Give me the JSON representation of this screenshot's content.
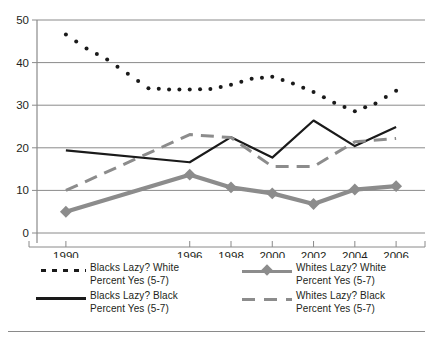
{
  "chart_data": {
    "type": "line",
    "title": "",
    "subtitle": "",
    "xlabel": "",
    "ylabel": "",
    "xlim": [
      1988.6,
      2007.4
    ],
    "ylim": [
      0,
      50
    ],
    "grid": true,
    "legend_position": "bottom",
    "x_tick_labels": [
      "1990",
      "1996",
      "1998",
      "2000",
      "2002",
      "2004",
      "2006"
    ],
    "x_ticks": [
      1990,
      1996,
      1998,
      2000,
      2002,
      2004,
      2006
    ],
    "y_tick_labels": [
      "0",
      "10",
      "20",
      "30",
      "40",
      "50"
    ],
    "y_ticks": [
      0,
      10,
      20,
      30,
      40,
      50
    ],
    "series": [
      {
        "name": "Blacks Lazy? White Percent Yes (5-7)",
        "style": "dotted",
        "color": "#1a1a1a",
        "marker": "dot",
        "x": [
          1990,
          1991,
          1992,
          1993,
          1994,
          1995,
          1996,
          1997,
          1998,
          1999,
          2000,
          2001,
          2002,
          2003,
          2004,
          2005,
          2006
        ],
        "values": [
          46.6,
          43.3,
          40.7,
          37.4,
          34.0,
          33.7,
          33.7,
          33.8,
          34.8,
          36.2,
          36.7,
          35.1,
          33.1,
          30.6,
          28.6,
          30.4,
          33.4
        ]
      },
      {
        "name": "Blacks Lazy? Black Percent Yes (5-7)",
        "style": "solid",
        "color": "#1a1a1a",
        "marker": "none",
        "x": [
          1990,
          1996,
          1998,
          2000,
          2002,
          2004,
          2006
        ],
        "values": [
          19.4,
          16.6,
          22.5,
          17.7,
          26.4,
          20.4,
          24.9
        ]
      },
      {
        "name": "Whites Lazy? White Percent Yes (5-7)",
        "style": "solid-thick",
        "color": "#8c8c8c",
        "marker": "diamond",
        "x": [
          1990,
          1996,
          1998,
          2000,
          2002,
          2004,
          2006
        ],
        "values": [
          5.0,
          13.7,
          10.7,
          9.3,
          6.8,
          10.2,
          11.0
        ]
      },
      {
        "name": "Whites Lazy? Black Percent Yes (5-7)",
        "style": "dashed",
        "color": "#8c8c8c",
        "marker": "none",
        "x": [
          1990,
          1996,
          1998,
          2000,
          2002,
          2004,
          2006
        ],
        "values": [
          10.0,
          23.1,
          22.4,
          15.6,
          15.6,
          21.4,
          22.2
        ]
      }
    ]
  },
  "legend": {
    "entries": [
      {
        "key": "dotted-key",
        "label": "Blacks Lazy? White\nPercent Yes (5-7)"
      },
      {
        "key": "diamond-marker-key",
        "label": "Whites Lazy? White\nPercent Yes (5-7)"
      },
      {
        "key": "solid-key",
        "label": "Blacks Lazy? Black\nPercent Yes (5-7)"
      },
      {
        "key": "dashed-key",
        "label": "Whites Lazy? Black\nPercent Yes (5-7)"
      }
    ]
  },
  "axes": {
    "y_labels": [
      "50",
      "40",
      "30",
      "20",
      "10",
      "0"
    ],
    "x_labels": [
      "1990",
      "1996",
      "1998",
      "2000",
      "2002",
      "2004",
      "2006"
    ]
  },
  "colors": {
    "dark": "#1a1a1a",
    "gray": "#8c8c8c",
    "grid": "#8a8a8a",
    "axis": "#8a8a8a",
    "background": "#ffffff"
  }
}
